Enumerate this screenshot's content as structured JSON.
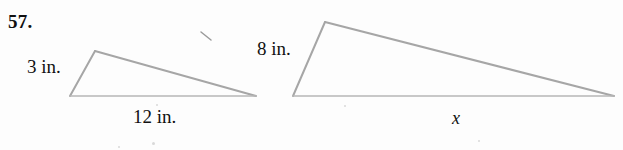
{
  "exercise": {
    "number": "57."
  },
  "figures": {
    "left_triangle": {
      "name": "small-triangle",
      "side_label": "3 in.",
      "base_label": "12 in.",
      "vertices": {
        "apex": [
          95,
          51
        ],
        "bottom_left": [
          70,
          96
        ],
        "bottom_right": [
          256,
          96
        ]
      }
    },
    "right_triangle": {
      "name": "large-triangle",
      "side_label": "8 in.",
      "base_label": "x",
      "vertices": {
        "apex": [
          325,
          22
        ],
        "bottom_left": [
          293,
          96
        ],
        "bottom_right": [
          614,
          96
        ]
      }
    }
  },
  "style": {
    "stroke_color": "#a6a6a6",
    "base_stroke_color": "#b3b3b3",
    "stroke_width": 2,
    "background": "#fdfdfd",
    "text_color": "#111111"
  },
  "marks": {
    "stray_tick": "stray-pencil-tick"
  }
}
